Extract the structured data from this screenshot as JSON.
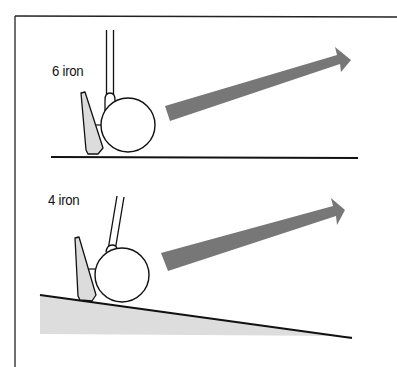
{
  "diagram": {
    "panels": [
      {
        "label": "6 iron",
        "club": "6 iron",
        "lie": "flat ground",
        "arrow": "trajectory"
      },
      {
        "label": "4 iron",
        "club": "4 iron",
        "lie": "downhill slope",
        "arrow": "trajectory"
      }
    ],
    "colors": {
      "arrow": "#777777",
      "ground_fill": "#dddddd",
      "clubhead_fill": "#dcdcdc",
      "line": "#111111"
    }
  }
}
